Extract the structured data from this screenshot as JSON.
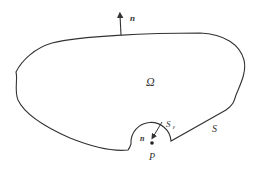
{
  "diagram": {
    "title": "",
    "labels": {
      "domain": "Ω",
      "boundary": "S",
      "small_boundary_main": "S",
      "small_boundary_sub": "ε",
      "point": "P",
      "outer_normal": "n",
      "inner_normal": "n"
    },
    "colors": {
      "stroke": "#333333",
      "background": "#ffffff"
    }
  }
}
